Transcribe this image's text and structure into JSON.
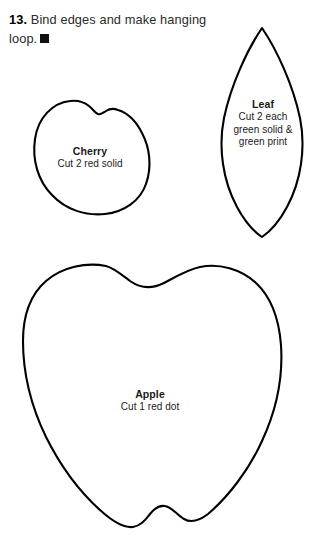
{
  "page": {
    "background_color": "#ffffff",
    "ink_color": "#000000"
  },
  "instruction": {
    "step_number": "13.",
    "text": "Bind edges and make hanging loop.",
    "end_mark_icon": "filled-square-icon"
  },
  "pieces": [
    {
      "id": "cherry",
      "shape_icon": "cherry-outline-shape",
      "title": "Cherry",
      "lines": [
        "Cut 2 red solid"
      ]
    },
    {
      "id": "leaf",
      "shape_icon": "leaf-outline-shape",
      "title": "Leaf",
      "lines": [
        "Cut 2 each",
        "green solid &",
        "green print"
      ]
    },
    {
      "id": "apple",
      "shape_icon": "apple-outline-shape",
      "title": "Apple",
      "lines": [
        "Cut 1 red dot"
      ]
    }
  ]
}
